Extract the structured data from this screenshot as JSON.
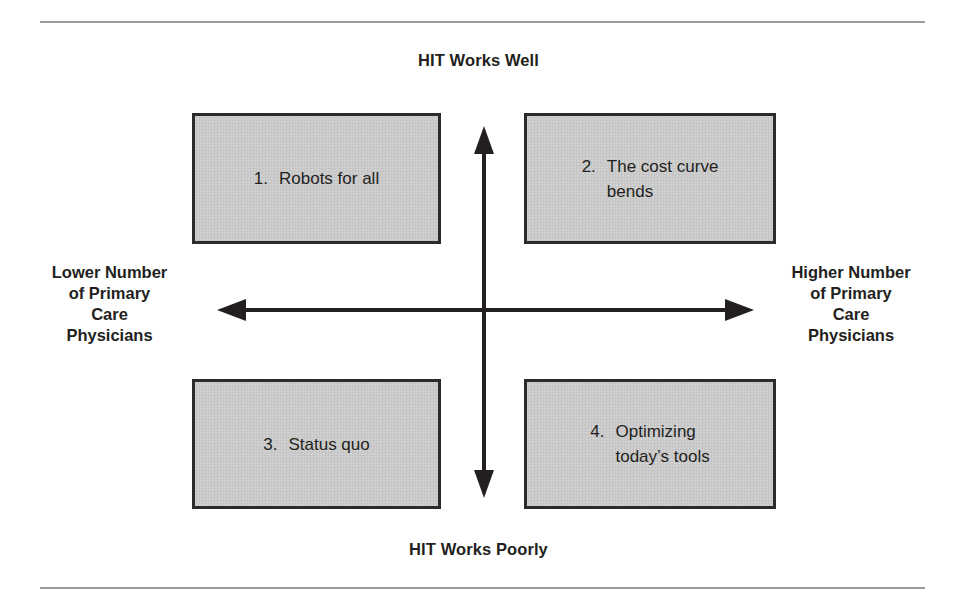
{
  "figure": {
    "type": "2x2-quadrant-matrix",
    "background_color": "#ffffff",
    "rule_color": "#9b9b9b",
    "box_fill_color": "#c9c9c9",
    "box_border_color": "#2b2b2b",
    "text_color": "#231f20"
  },
  "axes": {
    "vertical": {
      "top_label": "HIT Works Well",
      "bottom_label": "HIT Works Poorly"
    },
    "horizontal": {
      "left_label_lines": [
        "Lower Number",
        "of Primary",
        "Care",
        "Physicians"
      ],
      "right_label_lines": [
        "Higher Number",
        "of Primary",
        "Care",
        "Physicians"
      ],
      "left_label": "Lower Number of Primary Care Physicians",
      "right_label": "Higher Number of Primary Care Physicians"
    }
  },
  "quadrants": [
    {
      "id": 1,
      "number": "1.",
      "lines": [
        "Robots for all"
      ],
      "text": "Robots for all",
      "position": "top-left",
      "hit": "HIT Works Well",
      "pcp": "Lower Number of Primary Care Physicians"
    },
    {
      "id": 2,
      "number": "2.",
      "lines": [
        "The cost curve",
        "bends"
      ],
      "text": "The cost curve bends",
      "position": "top-right",
      "hit": "HIT Works Well",
      "pcp": "Higher Number of Primary Care Physicians"
    },
    {
      "id": 3,
      "number": "3.",
      "lines": [
        "Status quo"
      ],
      "text": "Status quo",
      "position": "bottom-left",
      "hit": "HIT Works Poorly",
      "pcp": "Lower Number of Primary Care Physicians"
    },
    {
      "id": 4,
      "number": "4.",
      "lines": [
        "Optimizing",
        "today’s tools"
      ],
      "text": "Optimizing today’s tools",
      "position": "bottom-right",
      "hit": "HIT Works Poorly",
      "pcp": "Higher Number of Primary Care Physicians"
    }
  ]
}
